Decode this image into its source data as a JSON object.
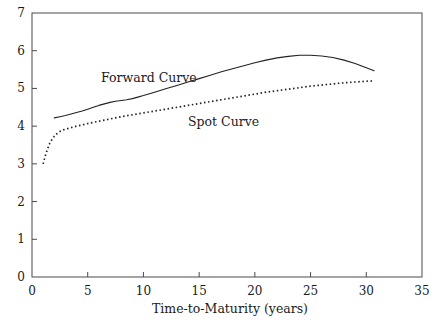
{
  "chart_data": {
    "type": "line",
    "title": "",
    "xlabel": "Time-to-Maturity (years)",
    "ylabel": "",
    "xlim": [
      0,
      35
    ],
    "ylim": [
      0,
      7
    ],
    "xticks": [
      0,
      5,
      10,
      15,
      20,
      25,
      30,
      35
    ],
    "xtick_labels": [
      "0",
      "5",
      "10",
      "15",
      "20",
      "25",
      "30",
      "35"
    ],
    "yticks": [
      0,
      1,
      2,
      3,
      4,
      5,
      6,
      7
    ],
    "ytick_labels": [
      "0",
      "1",
      "2",
      "3",
      "4",
      "5",
      "6",
      "7"
    ],
    "grid": false,
    "legend": "inline-annotations",
    "annotations": [
      {
        "text": "Forward Curve",
        "x": 6.2,
        "y": 5.28
      },
      {
        "text": "Spot Curve",
        "x": 14.0,
        "y": 4.12
      }
    ],
    "series": [
      {
        "name": "Forward Curve",
        "style": "solid",
        "color": "#222222",
        "points": [
          [
            2.0,
            4.22
          ],
          [
            2.5,
            4.25
          ],
          [
            3.0,
            4.28
          ],
          [
            3.5,
            4.32
          ],
          [
            4.0,
            4.36
          ],
          [
            4.5,
            4.4
          ],
          [
            5.0,
            4.45
          ],
          [
            5.5,
            4.5
          ],
          [
            6.0,
            4.55
          ],
          [
            6.5,
            4.59
          ],
          [
            7.0,
            4.63
          ],
          [
            7.5,
            4.66
          ],
          [
            8.0,
            4.68
          ],
          [
            8.5,
            4.7
          ],
          [
            9.0,
            4.73
          ],
          [
            9.5,
            4.77
          ],
          [
            10.0,
            4.81
          ],
          [
            11.0,
            4.9
          ],
          [
            12.0,
            4.99
          ],
          [
            13.0,
            5.08
          ],
          [
            14.0,
            5.17
          ],
          [
            15.0,
            5.26
          ],
          [
            16.0,
            5.35
          ],
          [
            17.0,
            5.44
          ],
          [
            18.0,
            5.52
          ],
          [
            19.0,
            5.6
          ],
          [
            20.0,
            5.68
          ],
          [
            21.0,
            5.75
          ],
          [
            22.0,
            5.81
          ],
          [
            23.0,
            5.85
          ],
          [
            24.0,
            5.88
          ],
          [
            24.5,
            5.88
          ],
          [
            25.0,
            5.88
          ],
          [
            26.0,
            5.86
          ],
          [
            27.0,
            5.82
          ],
          [
            28.0,
            5.75
          ],
          [
            29.0,
            5.66
          ],
          [
            30.0,
            5.55
          ],
          [
            30.7,
            5.47
          ]
        ]
      },
      {
        "name": "Spot Curve",
        "style": "dotted",
        "color": "#222222",
        "points": [
          [
            1.0,
            3.0
          ],
          [
            1.2,
            3.22
          ],
          [
            1.4,
            3.4
          ],
          [
            1.6,
            3.55
          ],
          [
            1.8,
            3.65
          ],
          [
            2.0,
            3.73
          ],
          [
            2.2,
            3.79
          ],
          [
            2.4,
            3.84
          ],
          [
            2.6,
            3.87
          ],
          [
            2.8,
            3.9
          ],
          [
            3.0,
            3.92
          ],
          [
            3.5,
            3.96
          ],
          [
            4.0,
            4.0
          ],
          [
            4.5,
            4.03
          ],
          [
            5.0,
            4.07
          ],
          [
            5.5,
            4.1
          ],
          [
            6.0,
            4.13
          ],
          [
            6.5,
            4.16
          ],
          [
            7.0,
            4.19
          ],
          [
            7.5,
            4.22
          ],
          [
            8.0,
            4.25
          ],
          [
            9.0,
            4.3
          ],
          [
            10.0,
            4.35
          ],
          [
            11.0,
            4.4
          ],
          [
            12.0,
            4.45
          ],
          [
            13.0,
            4.5
          ],
          [
            14.0,
            4.55
          ],
          [
            15.0,
            4.6
          ],
          [
            16.0,
            4.65
          ],
          [
            17.0,
            4.7
          ],
          [
            18.0,
            4.75
          ],
          [
            19.0,
            4.8
          ],
          [
            20.0,
            4.85
          ],
          [
            21.0,
            4.9
          ],
          [
            22.0,
            4.94
          ],
          [
            23.0,
            4.98
          ],
          [
            24.0,
            5.02
          ],
          [
            25.0,
            5.06
          ],
          [
            26.0,
            5.09
          ],
          [
            27.0,
            5.12
          ],
          [
            28.0,
            5.15
          ],
          [
            29.0,
            5.17
          ],
          [
            30.0,
            5.19
          ],
          [
            30.7,
            5.2
          ]
        ]
      }
    ]
  },
  "figure": {
    "background_color": "#ffffff",
    "axis_color": "#4a4a4a",
    "text_color": "#1a1a1a"
  }
}
